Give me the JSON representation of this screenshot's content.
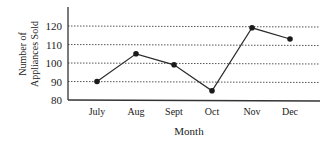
{
  "chart_data": {
    "type": "line",
    "title": "",
    "xlabel": "Month",
    "ylabel": "Number of Appliances Sold",
    "ylabel_lines": [
      "Number of",
      "Appliances Sold"
    ],
    "categories": [
      "July",
      "Aug",
      "Sept",
      "Oct",
      "Nov",
      "Dec"
    ],
    "series": [
      {
        "name": "Appliances Sold",
        "values": [
          90,
          105,
          99,
          85,
          119,
          113
        ]
      }
    ],
    "yticks": [
      80,
      90,
      100,
      110,
      120
    ],
    "ylim": [
      80,
      120
    ],
    "grid": {
      "horizontal": true,
      "style": "dotted",
      "lines_at": [
        90,
        100,
        110,
        120
      ]
    },
    "legend": null
  },
  "colors": {
    "line": "#2a2a2a",
    "marker": "#1a1a1a",
    "grid": "#555555",
    "axis": "#333333"
  }
}
